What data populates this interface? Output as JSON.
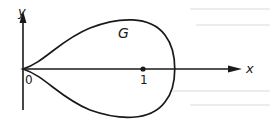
{
  "figure": {
    "type": "curve-on-axes",
    "region_label": "G",
    "axes": {
      "x_label": "x",
      "y_label": "y",
      "origin_label": "0"
    },
    "marked_point": {
      "label": "1",
      "x": 1,
      "y": 0
    },
    "colors": {
      "ink": "#1a1a1a",
      "background": "#ffffff"
    }
  }
}
